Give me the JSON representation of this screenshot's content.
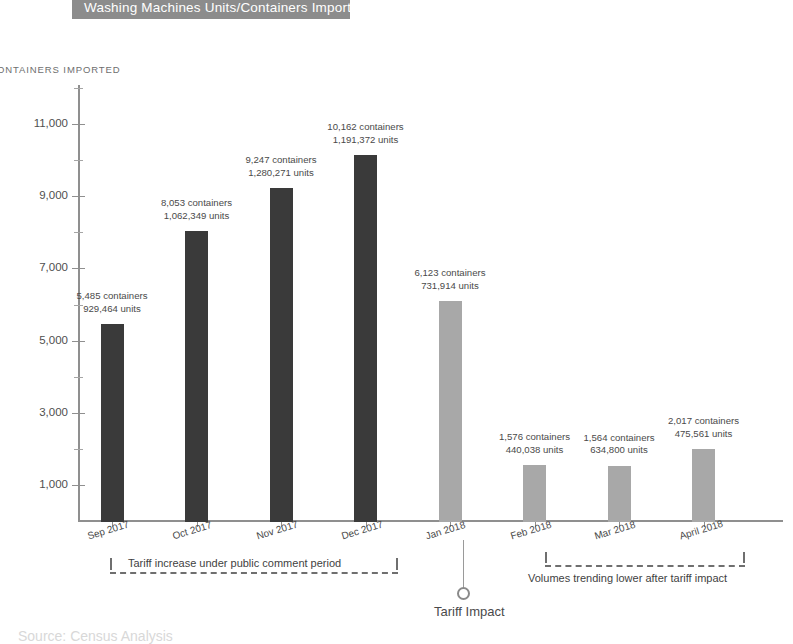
{
  "title": {
    "text": "Washing Machines Units/Containers Imported",
    "banner_color": "#8c8c8c",
    "text_color": "#ffffff"
  },
  "axis": {
    "y_title": "ONTAINERS IMPORTED",
    "y_ticks": [
      "1,000",
      "3,000",
      "5,000",
      "7,000",
      "9,000",
      "11,000"
    ]
  },
  "annotations": {
    "left_bracket_text": "Tariff increase under public comment period",
    "right_bracket_text": "Volumes trending lower after tariff impact",
    "callout_label": "Tariff Impact"
  },
  "source_note": "Source: Census Analysis",
  "chart_data": {
    "type": "bar",
    "title": "Washing Machines Units/Containers Imported",
    "xlabel": "",
    "ylabel": "CONTAINERS IMPORTED",
    "ylim": [
      0,
      12000
    ],
    "ytick_values": [
      1000,
      3000,
      5000,
      7000,
      9000,
      11000
    ],
    "ytick_labels": [
      "1,000",
      "3,000",
      "5,000",
      "7,000",
      "9,000",
      "11,000"
    ],
    "grid": false,
    "legend": "none",
    "categories": [
      "Sep 2017",
      "Oct 2017",
      "Nov 2017",
      "Dec 2017",
      "Jan 2018",
      "Feb 2018",
      "Mar 2018",
      "April 2018"
    ],
    "values": [
      5485,
      8053,
      9247,
      10162,
      6123,
      1576,
      1564,
      2017
    ],
    "series": [
      {
        "name": "Containers Imported",
        "values": [
          5485,
          8053,
          9247,
          10162,
          6123,
          1576,
          1564,
          2017
        ]
      },
      {
        "name": "Units Imported",
        "values": [
          929464,
          1062349,
          1280271,
          1191372,
          731914,
          440038,
          634800,
          475561
        ]
      }
    ],
    "bar_colors": [
      "#3a3a3a",
      "#3a3a3a",
      "#3a3a3a",
      "#3a3a3a",
      "#a8a8a8",
      "#a8a8a8",
      "#a8a8a8",
      "#a8a8a8"
    ],
    "bars": [
      {
        "category": "Sep 2017",
        "containers": 5485,
        "units": 929464,
        "color": "#3a3a3a",
        "label_line1": "5,485 containers",
        "label_line2": "929,464 units"
      },
      {
        "category": "Oct 2017",
        "containers": 8053,
        "units": 1062349,
        "color": "#3a3a3a",
        "label_line1": "8,053 containers",
        "label_line2": "1,062,349 units"
      },
      {
        "category": "Nov 2017",
        "containers": 9247,
        "units": 1280271,
        "color": "#3a3a3a",
        "label_line1": "9,247 containers",
        "label_line2": "1,280,271 units"
      },
      {
        "category": "Dec 2017",
        "containers": 10162,
        "units": 1191372,
        "color": "#3a3a3a",
        "label_line1": "10,162 containers",
        "label_line2": "1,191,372 units"
      },
      {
        "category": "Jan 2018",
        "containers": 6123,
        "units": 731914,
        "color": "#a8a8a8",
        "label_line1": "6,123 containers",
        "label_line2": "731,914 units"
      },
      {
        "category": "Feb 2018",
        "containers": 1576,
        "units": 440038,
        "color": "#a8a8a8",
        "label_line1": "1,576 containers",
        "label_line2": "440,038 units"
      },
      {
        "category": "Mar 2018",
        "containers": 1564,
        "units": 634800,
        "color": "#a8a8a8",
        "label_line1": "1,564 containers",
        "label_line2": "634,800 units"
      },
      {
        "category": "April 2018",
        "containers": 2017,
        "units": 475561,
        "color": "#a8a8a8",
        "label_line1": "2,017 containers",
        "label_line2": "475,561 units"
      }
    ],
    "annotations": [
      {
        "text": "Tariff increase under public comment period",
        "spans": [
          "Sep 2017",
          "Dec 2017"
        ]
      },
      {
        "text": "Volumes trending lower after tariff impact",
        "spans": [
          "Feb 2018",
          "April 2018"
        ]
      },
      {
        "text": "Tariff Impact",
        "points_at": "Jan 2018"
      }
    ]
  }
}
